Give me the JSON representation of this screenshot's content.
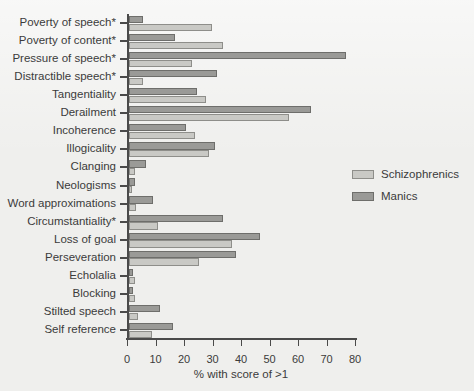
{
  "chart_data": {
    "type": "bar",
    "orientation": "horizontal",
    "title": "",
    "subtitle": "",
    "xlabel": "% with score of >1",
    "ylabel": "",
    "xlim": [
      0,
      80
    ],
    "xticks": [
      0,
      10,
      20,
      30,
      40,
      50,
      60,
      70,
      80
    ],
    "xtick_labels": [
      "0",
      "10",
      "20",
      "30",
      "40",
      "50",
      "60",
      "70",
      "80"
    ],
    "grid": false,
    "legend_position": "right",
    "categories": [
      "Poverty of speech*",
      "Poverty of content*",
      "Pressure of speech*",
      "Distractible speech*",
      "Tangentiality",
      "Derailment",
      "Incoherence",
      "Illogicality",
      "Clanging",
      "Neologisms",
      "Word approximations",
      "Circumstantiality*",
      "Loss of goal",
      "Perseveration",
      "Echolalia",
      "Blocking",
      "Stilted speech",
      "Self reference"
    ],
    "series": [
      {
        "name": "Schizophrenics",
        "color": "#c9c9c5",
        "values": [
          29,
          33,
          22,
          5,
          27,
          56,
          23,
          28,
          2,
          1,
          2.5,
          10,
          36,
          24.5,
          2,
          2,
          3,
          8
        ]
      },
      {
        "name": "Manics",
        "color": "#9a9a97",
        "values": [
          5,
          16,
          76,
          31,
          24,
          64,
          20,
          30,
          6,
          2,
          8.5,
          33,
          46,
          37.5,
          1.5,
          1.5,
          11,
          15.5
        ]
      }
    ],
    "annotations": [
      "* indicates significant difference"
    ]
  },
  "legend": {
    "items": [
      {
        "label": "Schizophrenics",
        "swatch": "schizo"
      },
      {
        "label": "Manics",
        "swatch": "manic"
      }
    ]
  }
}
